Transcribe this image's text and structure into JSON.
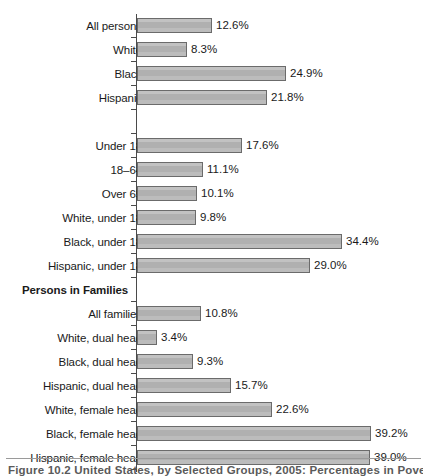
{
  "chart_data": {
    "type": "bar",
    "orientation": "horizontal",
    "title": "",
    "xlabel": "",
    "ylabel": "",
    "xlim": [
      0,
      42
    ],
    "grid": false,
    "legend": null,
    "value_suffix": "%",
    "categories": [
      "All persons",
      "White",
      "Black",
      "Hispanic",
      "",
      "Under 18",
      "18–64",
      "Over 65",
      "White, under 18",
      "Black, under 18",
      "Hispanic, under 18",
      "Persons in Families",
      "All families",
      "White, dual head",
      "Black, dual head",
      "Hispanic, dual head",
      "White, female head",
      "Black, female head",
      "Hispanic, female head"
    ],
    "values": [
      12.6,
      8.3,
      24.9,
      21.8,
      null,
      17.6,
      11.1,
      10.1,
      9.8,
      34.4,
      29.0,
      null,
      10.8,
      3.4,
      9.3,
      15.7,
      22.6,
      39.2,
      39.0
    ],
    "labels": [
      "12.6%",
      "8.3%",
      "24.9%",
      "21.8%",
      "",
      "17.6%",
      "11.1%",
      "10.1%",
      "9.8%",
      "34.4%",
      "29.0%",
      "",
      "10.8%",
      "3.4%",
      "9.3%",
      "15.7%",
      "22.6%",
      "39.2%",
      "39.0%"
    ]
  },
  "rows": [
    {
      "label": "All persons",
      "value": 12.6,
      "value_label": "12.6%",
      "kind": "bar"
    },
    {
      "label": "White",
      "value": 8.3,
      "value_label": "8.3%",
      "kind": "bar"
    },
    {
      "label": "Black",
      "value": 24.9,
      "value_label": "24.9%",
      "kind": "bar"
    },
    {
      "label": "Hispanic",
      "value": 21.8,
      "value_label": "21.8%",
      "kind": "bar"
    },
    {
      "label": "",
      "value": null,
      "value_label": "",
      "kind": "spacer"
    },
    {
      "label": "Under 18",
      "value": 17.6,
      "value_label": "17.6%",
      "kind": "bar"
    },
    {
      "label": "18–64",
      "value": 11.1,
      "value_label": "11.1%",
      "kind": "bar"
    },
    {
      "label": "Over 65",
      "value": 10.1,
      "value_label": "10.1%",
      "kind": "bar"
    },
    {
      "label": "White, under 18",
      "value": 9.8,
      "value_label": "9.8%",
      "kind": "bar"
    },
    {
      "label": "Black, under 18",
      "value": 34.4,
      "value_label": "34.4%",
      "kind": "bar"
    },
    {
      "label": "Hispanic, under 18",
      "value": 29.0,
      "value_label": "29.0%",
      "kind": "bar"
    },
    {
      "label": "Persons in Families",
      "value": null,
      "value_label": "",
      "kind": "group"
    },
    {
      "label": "All families",
      "value": 10.8,
      "value_label": "10.8%",
      "kind": "bar"
    },
    {
      "label": "White, dual head",
      "value": 3.4,
      "value_label": "3.4%",
      "kind": "bar"
    },
    {
      "label": "Black, dual head",
      "value": 9.3,
      "value_label": "9.3%",
      "kind": "bar"
    },
    {
      "label": "Hispanic, dual head",
      "value": 15.7,
      "value_label": "15.7%",
      "kind": "bar"
    },
    {
      "label": "White, female head",
      "value": 22.6,
      "value_label": "22.6%",
      "kind": "bar"
    },
    {
      "label": "Black, female head",
      "value": 39.2,
      "value_label": "39.2%",
      "kind": "bar"
    },
    {
      "label": "Hispanic, female head",
      "value": 39.0,
      "value_label": "39.0%",
      "kind": "bar"
    }
  ],
  "caption": {
    "text": "Figure 10.2  United States, by Selected Groups, 2005: Percentages in Poverty"
  },
  "style": {
    "bar_fill": "#b3b3b3",
    "bar_border": "#6b6b6b",
    "axis_color": "#4a4a4a",
    "text_color": "#1a1a1a",
    "caption_color": "#5a5a5a",
    "background": "#ffffff"
  }
}
